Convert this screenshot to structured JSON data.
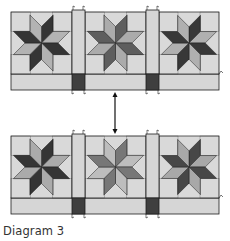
{
  "caption": "Diagram 3",
  "colors": {
    "background": "#d9d9d9",
    "sashing": "#d6d6d6",
    "cornerstone": "#3f3f3f",
    "outline": "#1e1e1e",
    "arrow": "#111111"
  },
  "rows": [
    {
      "name": "top-row",
      "blocks": [
        {
          "name": "star-block-1",
          "dark": "#353535",
          "light": "#b3b3b3"
        },
        {
          "name": "star-block-2",
          "dark": "#5e5e5e",
          "light": "#ababab"
        },
        {
          "name": "star-block-3",
          "dark": "#383838",
          "light": "#b0b0b0"
        }
      ]
    },
    {
      "name": "bottom-row",
      "blocks": [
        {
          "name": "star-block-4",
          "dark": "#353535",
          "light": "#ababab"
        },
        {
          "name": "star-block-5",
          "dark": "#777777",
          "light": "#bdbdbd"
        },
        {
          "name": "star-block-6",
          "dark": "#474747",
          "light": "#a8a8a8"
        }
      ]
    }
  ],
  "connector": {
    "type": "double-headed-arrow",
    "direction": "vertical"
  }
}
